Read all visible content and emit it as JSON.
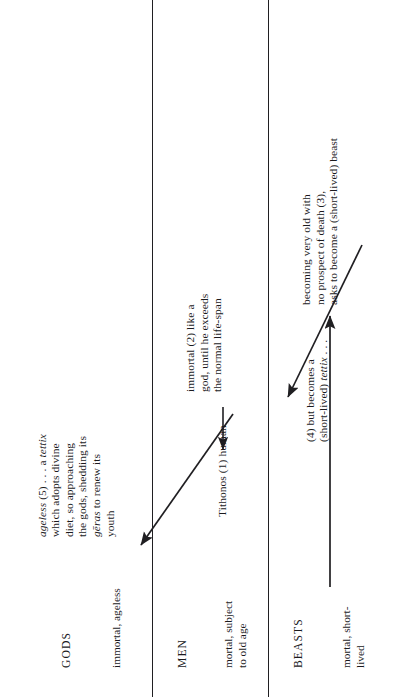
{
  "figure": {
    "rows": [
      {
        "id": "gods",
        "category": "GODS",
        "state": "immortal, ageless"
      },
      {
        "id": "men",
        "category": "MEN",
        "state": "mortal, subject\nto old age"
      },
      {
        "id": "beasts",
        "category": "BEASTS",
        "state": "mortal, short-\nlived"
      }
    ],
    "notes": [
      {
        "id": "note-5",
        "row": "gods",
        "lines": [
          {
            "text": "ageless",
            "style": "italic"
          },
          {
            "text": " (5)",
            "style": "normal"
          },
          {
            "text": " . . . a ",
            "style": "normal"
          },
          {
            "text": "tettix",
            "style": "italic"
          },
          {
            "text": "\nwhich adopts divine\ndiet, so approaching\nthe gods, shedding its\n",
            "style": "normal"
          },
          {
            "text": "gēras",
            "style": "italic"
          },
          {
            "text": " to renew its\nyouth",
            "style": "normal"
          }
        ],
        "plain": "ageless (5) . . . a tettix which adopts divine diet, so approaching the gods, shedding its geras to renew its youth"
      },
      {
        "id": "note-2",
        "row": "men",
        "plain": "immortal (2) like a\ngod, until he exceeds\nthe normal life-span"
      },
      {
        "id": "note-1",
        "row": "men",
        "plain": "Tithonos (1) human"
      },
      {
        "id": "note-4",
        "row": "beasts",
        "lines": [
          {
            "text": "(4) but becomes a\n(short-lived) ",
            "style": "normal"
          },
          {
            "text": "tettix",
            "style": "italic"
          },
          {
            "text": " . . .",
            "style": "normal"
          }
        ],
        "plain": "(4) but becomes a (short-lived) tettix . . ."
      },
      {
        "id": "note-3",
        "row": "beasts",
        "plain": "becoming very old with\nno prospect of death (3),\nasks to become a (short-lived) beast"
      }
    ],
    "arrows": [
      {
        "id": "arrow-1-to-2",
        "label": "human becomes immortal",
        "from": "Tithonos (1) human",
        "to": "immortal (2)"
      },
      {
        "id": "arrow-2-to-3",
        "label": "exceeds lifespan, asks to become a beast",
        "from": "immortal (2)",
        "to": "becoming very old (3)"
      },
      {
        "id": "arrow-3-to-4",
        "label": "becomes a short-lived tettix",
        "from": "becoming very old (3)",
        "to": "(4) tettix"
      },
      {
        "id": "arrow-4-to-5",
        "label": "tettix adopts divine diet and becomes ageless",
        "from": "(4) tettix",
        "to": "ageless (5)"
      }
    ],
    "colors": {
      "ink": "#1b1a1d",
      "line": "#201f22",
      "background": "#ffffff"
    }
  }
}
